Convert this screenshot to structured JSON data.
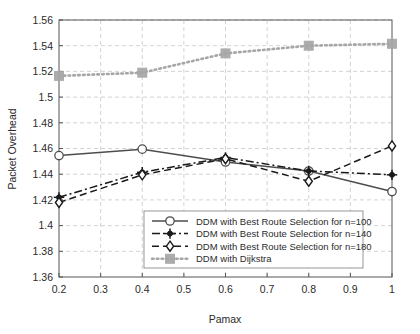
{
  "chart_data": {
    "type": "line",
    "title": "",
    "xlabel": "Pamax",
    "ylabel": "Packet Overhead",
    "xlim": [
      0.2,
      1.0
    ],
    "ylim": [
      1.36,
      1.56
    ],
    "grid": true,
    "legend_position": "bottom-right",
    "x": [
      0.2,
      0.4,
      0.6,
      0.8,
      1.0
    ],
    "xticks": [
      "0.2",
      "0.3",
      "0.4",
      "0.5",
      "0.6",
      "0.7",
      "0.8",
      "0.9",
      "1"
    ],
    "xtick_values": [
      0.2,
      0.3,
      0.4,
      0.5,
      0.6,
      0.7,
      0.8,
      0.9,
      1.0
    ],
    "yticks": [
      "1.36",
      "1.38",
      "1.4",
      "1.42",
      "1.44",
      "1.46",
      "1.48",
      "1.5",
      "1.52",
      "1.54",
      "1.56"
    ],
    "ytick_values": [
      1.36,
      1.38,
      1.4,
      1.42,
      1.44,
      1.46,
      1.48,
      1.5,
      1.52,
      1.54,
      1.56
    ],
    "series": [
      {
        "name": "DDM with Best Route Selection for n=100",
        "marker": "circle",
        "line_style": "solid",
        "color": "#4d4d4d",
        "values": [
          1.4545,
          1.4595,
          1.4495,
          1.4425,
          1.4265
        ]
      },
      {
        "name": "DDM with Best Route Selection for n=140",
        "marker": "plus-filled",
        "line_style": "dash-dot",
        "color": "#1a1a1a",
        "values": [
          1.422,
          1.4415,
          1.453,
          1.4425,
          1.4395
        ]
      },
      {
        "name": "DDM with Best Route Selection for n=180",
        "marker": "diamond",
        "line_style": "dashed",
        "color": "#1a1a1a",
        "values": [
          1.418,
          1.4395,
          1.452,
          1.4345,
          1.462
        ]
      },
      {
        "name": "DDM with Dijkstra",
        "marker": "square",
        "line_style": "dotted",
        "color": "#a6a6a6",
        "values": [
          1.5165,
          1.519,
          1.534,
          1.54,
          1.5415
        ]
      }
    ]
  },
  "legend": {
    "items": [
      {
        "label": "DDM with Best Route Selection for n=100"
      },
      {
        "label": "DDM with Best Route Selection for n=140"
      },
      {
        "label": "DDM with Best Route Selection for n=180"
      },
      {
        "label": "DDM with Dijkstra"
      }
    ]
  },
  "colors": {
    "axis": "#555555",
    "grid": "#c8c8c8",
    "series_gray": "#4d4d4d",
    "series_black": "#1a1a1a",
    "series_light": "#a6a6a6",
    "background": "#ffffff"
  }
}
